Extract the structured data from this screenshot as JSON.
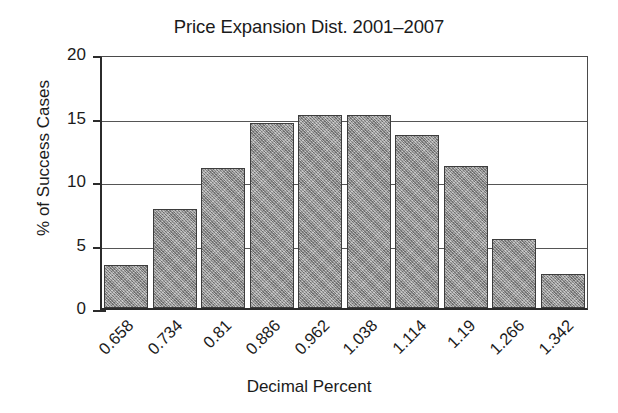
{
  "chart_data": {
    "type": "bar",
    "title": "Price Expansion Dist. 2001–2007",
    "xlabel": "Decimal Percent",
    "ylabel": "% of Success Cases",
    "categories": [
      "0.658",
      "0.734",
      "0.81",
      "0.886",
      "0.962",
      "1.038",
      "1.114",
      "1.19",
      "1.266",
      "1.342"
    ],
    "values": [
      3.4,
      7.8,
      11.0,
      14.6,
      15.2,
      15.2,
      13.6,
      11.2,
      5.4,
      2.7
    ],
    "ylim": [
      0,
      20
    ],
    "ytick_labels": [
      "0",
      "5",
      "10",
      "15",
      "20"
    ],
    "ytick_values": [
      0,
      5,
      10,
      15,
      20
    ],
    "grid": "horizontal",
    "legend": "none",
    "bar_color": "#9b9b9b",
    "bar_edge_color": "#3d3d3d",
    "axis_color": "#2b2b2b",
    "background_color": "#ffffff"
  }
}
